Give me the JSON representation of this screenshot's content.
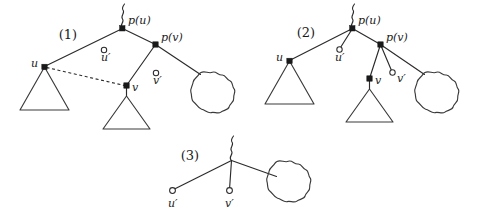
{
  "figure": {
    "background_color": "#ffffff",
    "stroke_color": "#2b2b2b",
    "node_fill_color": "#1a1a1a",
    "open_node_fill_color": "#ffffff",
    "width": 479,
    "height": 222
  },
  "panels": [
    {
      "id": "panel-1",
      "number_label": "(1)",
      "labels": {
        "p_u": "p(u)",
        "p_v": "p(v)",
        "u": "u",
        "v": "v",
        "u_prime": "u′",
        "v_prime": "v′"
      },
      "nodes": [
        {
          "name": "p(u)",
          "type": "filled-square",
          "connected": true
        },
        {
          "name": "p(v)",
          "type": "filled-square",
          "connected": true
        },
        {
          "name": "u",
          "type": "filled-square",
          "connected": true
        },
        {
          "name": "v",
          "type": "filled-square",
          "connected": true
        },
        {
          "name": "u′",
          "type": "open-circle",
          "connected": false
        },
        {
          "name": "v′",
          "type": "open-circle",
          "connected": false
        }
      ],
      "edges": [
        {
          "from": "p(u)",
          "to": "u",
          "style": "solid"
        },
        {
          "from": "p(u)",
          "to": "p(v)",
          "style": "solid"
        },
        {
          "from": "p(v)",
          "to": "v",
          "style": "solid"
        },
        {
          "from": "p(v)",
          "to": "cloud",
          "style": "solid"
        },
        {
          "from": "u",
          "to": "v",
          "style": "dashed"
        }
      ],
      "subtrees": [
        {
          "name": "subtree-under-u",
          "shape": "triangle"
        },
        {
          "name": "subtree-under-v",
          "shape": "triangle"
        }
      ],
      "clouds": [
        {
          "name": "cloud-right",
          "shape": "scalloped-circle"
        }
      ],
      "has_top_squiggle": true
    },
    {
      "id": "panel-2",
      "number_label": "(2)",
      "labels": {
        "p_u": "p(u)",
        "p_v": "p(v)",
        "u": "u",
        "v": "v",
        "u_prime": "u′",
        "v_prime": "v′"
      },
      "nodes": [
        {
          "name": "p(u)",
          "type": "filled-square",
          "connected": true
        },
        {
          "name": "p(v)",
          "type": "filled-square",
          "connected": true
        },
        {
          "name": "u",
          "type": "filled-square",
          "connected": true
        },
        {
          "name": "v",
          "type": "filled-square",
          "connected": true
        },
        {
          "name": "u′",
          "type": "open-circle",
          "connected": true
        },
        {
          "name": "v′",
          "type": "open-circle",
          "connected": true
        }
      ],
      "edges": [
        {
          "from": "p(u)",
          "to": "u",
          "style": "solid"
        },
        {
          "from": "p(u)",
          "to": "u′",
          "style": "solid"
        },
        {
          "from": "p(u)",
          "to": "p(v)",
          "style": "solid"
        },
        {
          "from": "p(v)",
          "to": "v",
          "style": "solid"
        },
        {
          "from": "p(v)",
          "to": "v′",
          "style": "solid"
        },
        {
          "from": "p(v)",
          "to": "cloud",
          "style": "solid"
        }
      ],
      "subtrees": [
        {
          "name": "subtree-under-u",
          "shape": "triangle"
        },
        {
          "name": "subtree-under-v",
          "shape": "triangle"
        }
      ],
      "clouds": [
        {
          "name": "cloud-right",
          "shape": "scalloped-circle"
        }
      ],
      "has_top_squiggle": true
    },
    {
      "id": "panel-3",
      "number_label": "(3)",
      "labels": {
        "u_prime": "u′",
        "v_prime": "v′"
      },
      "nodes": [
        {
          "name": "u′",
          "type": "open-circle",
          "connected": true
        },
        {
          "name": "v′",
          "type": "open-circle",
          "connected": true
        }
      ],
      "edges": [
        {
          "from": "root",
          "to": "u′",
          "style": "solid"
        },
        {
          "from": "root",
          "to": "v′",
          "style": "solid"
        },
        {
          "from": "root",
          "to": "cloud",
          "style": "solid"
        }
      ],
      "subtrees": [],
      "clouds": [
        {
          "name": "cloud-right",
          "shape": "scalloped-circle"
        }
      ],
      "has_top_squiggle": true
    }
  ]
}
